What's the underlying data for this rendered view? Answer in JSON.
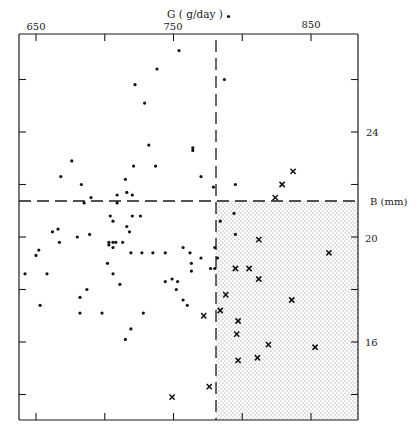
{
  "chart_data": {
    "type": "scatter",
    "title": "",
    "xlabel": "G ( g/day )",
    "ylabel": "B (mm)",
    "x_axis_position": "top",
    "y_axis_position": "right",
    "xlim": [
      637,
      885
    ],
    "ylim": [
      13.0,
      27.7
    ],
    "x_ticks": [
      650,
      700,
      750,
      800,
      850
    ],
    "x_tick_labels": [
      "650",
      "",
      "750",
      "",
      "850"
    ],
    "y_ticks": [
      14,
      16,
      18,
      20,
      22,
      24,
      26
    ],
    "y_tick_labels": [
      "",
      "16",
      "",
      "20",
      "",
      "24",
      ""
    ],
    "grid": false,
    "legend": null,
    "thresholds": {
      "G": 781,
      "B": 21.4
    },
    "shaded_region": {
      "G_min": 781,
      "B_max": 21.4,
      "pattern": "stipple"
    },
    "series": [
      {
        "name": "dot",
        "marker": "•",
        "points": [
          [
            668,
            22.3
          ],
          [
            662,
            20.2
          ],
          [
            667,
            19.8
          ],
          [
            721,
            22.7
          ],
          [
            715,
            22.2
          ],
          [
            737,
            22.7
          ],
          [
            729,
            25.1
          ],
          [
            722,
            25.8
          ],
          [
            738,
            26.4
          ],
          [
            732,
            23.5
          ],
          [
            754,
            27.1
          ],
          [
            790,
            28.4
          ],
          [
            764,
            23.4
          ],
          [
            764,
            23.3
          ],
          [
            770,
            22.3
          ],
          [
            795,
            22.0
          ],
          [
            787,
            26.0
          ],
          [
            779,
            21.9
          ],
          [
            706,
            20.6
          ],
          [
            676,
            22.9
          ],
          [
            683,
            22.0
          ],
          [
            690,
            21.5
          ],
          [
            709,
            21.6
          ],
          [
            716,
            21.7
          ],
          [
            720,
            21.6
          ],
          [
            685,
            21.3
          ],
          [
            709,
            21.3
          ],
          [
            704,
            20.8
          ],
          [
            720,
            20.8
          ],
          [
            726,
            20.8
          ],
          [
            716,
            20.4
          ],
          [
            718,
            20.2
          ],
          [
            666,
            20.3
          ],
          [
            680,
            20.0
          ],
          [
            689,
            20.1
          ],
          [
            703,
            19.8
          ],
          [
            703,
            19.7
          ],
          [
            706,
            19.8
          ],
          [
            708,
            19.8
          ],
          [
            713,
            19.8
          ],
          [
            706,
            19.6
          ],
          [
            719,
            19.4
          ],
          [
            727,
            19.4
          ],
          [
            735,
            19.4
          ],
          [
            744,
            19.4
          ],
          [
            702,
            19.0
          ],
          [
            757,
            19.6
          ],
          [
            762,
            19.4
          ],
          [
            770,
            19.2
          ],
          [
            753,
            18.3
          ],
          [
            744,
            18.3
          ],
          [
            749,
            18.4
          ],
          [
            763,
            19.0
          ],
          [
            763,
            18.7
          ],
          [
            777,
            18.8
          ],
          [
            650,
            19.3
          ],
          [
            652,
            19.5
          ],
          [
            658,
            18.6
          ],
          [
            642,
            18.6
          ],
          [
            706,
            18.6
          ],
          [
            711,
            18.2
          ],
          [
            687,
            18.0
          ],
          [
            682,
            17.7
          ],
          [
            752,
            18.0
          ],
          [
            757,
            17.6
          ],
          [
            760,
            17.4
          ],
          [
            653,
            17.4
          ],
          [
            682,
            17.1
          ],
          [
            698,
            17.1
          ],
          [
            728,
            17.1
          ],
          [
            719,
            16.5
          ],
          [
            715,
            16.1
          ],
          [
            794,
            20.9
          ],
          [
            784,
            20.6
          ],
          [
            795,
            20.1
          ],
          [
            780,
            19.6
          ],
          [
            782,
            19.2
          ],
          [
            780,
            18.8
          ]
        ]
      },
      {
        "name": "x",
        "marker": "×",
        "points": [
          [
            837,
            22.5
          ],
          [
            829,
            22.0
          ],
          [
            824,
            21.5
          ],
          [
            812,
            19.9
          ],
          [
            863,
            19.4
          ],
          [
            795,
            18.8
          ],
          [
            805,
            18.8
          ],
          [
            812,
            18.4
          ],
          [
            788,
            17.8
          ],
          [
            836,
            17.6
          ],
          [
            784,
            17.2
          ],
          [
            797,
            16.8
          ],
          [
            796,
            16.3
          ],
          [
            819,
            15.9
          ],
          [
            853,
            15.8
          ],
          [
            811,
            15.4
          ],
          [
            797,
            15.3
          ],
          [
            772,
            17.0
          ],
          [
            776,
            14.3
          ],
          [
            749,
            13.9
          ]
        ]
      }
    ]
  },
  "labels": {
    "x_title": "G ( g/day )",
    "y_title": "B  (mm)",
    "x650": "650",
    "x750": "750",
    "x850": "850",
    "y24": "24",
    "y20": "20",
    "y16": "16"
  }
}
